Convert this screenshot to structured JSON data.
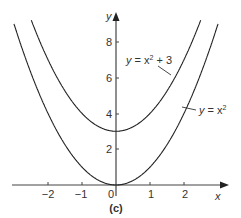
{
  "chart_data": {
    "type": "line",
    "title": "",
    "panel_label": "(c)",
    "xlabel": "x",
    "ylabel": "y",
    "xlim": [
      -3.4,
      3.6
    ],
    "ylim": [
      -0.5,
      10
    ],
    "x_ticks": [
      -2,
      -1,
      0,
      1,
      2
    ],
    "y_ticks": [
      2,
      4,
      6,
      8
    ],
    "grid": false,
    "series": [
      {
        "name": "y = x^2",
        "formula": "x^2",
        "x": [
          -2.5,
          -2,
          -1,
          0,
          1,
          2,
          2.5
        ],
        "values": [
          6.25,
          4,
          1,
          0,
          1,
          4,
          6.25
        ]
      },
      {
        "name": "y = x^2 + 3",
        "formula": "x^2+3",
        "x": [
          -2.5,
          -2,
          -1,
          0,
          1,
          2,
          2.5
        ],
        "values": [
          9.25,
          7,
          4,
          3,
          4,
          7,
          9.25
        ]
      }
    ],
    "annotations": [
      {
        "text": "y = x^2 + 3",
        "near": [
          1.7,
          5.9
        ]
      },
      {
        "text": "y = x^2",
        "near": [
          2.1,
          4.3
        ]
      }
    ]
  },
  "labels": {
    "x_axis": "x",
    "y_axis": "y",
    "panel": "(c)",
    "ann1_y": "y",
    "ann1_eq": " = x",
    "ann1_exp": "2",
    "ann1_tail": " + 3",
    "ann2_y": "y",
    "ann2_eq": " = x",
    "ann2_exp": "2",
    "xt_m2": "−2",
    "xt_m1": "−1",
    "xt_0": "0",
    "xt_1": "1",
    "xt_2": "2",
    "yt_2": "2",
    "yt_4": "4",
    "yt_6": "6",
    "yt_8": "8"
  }
}
